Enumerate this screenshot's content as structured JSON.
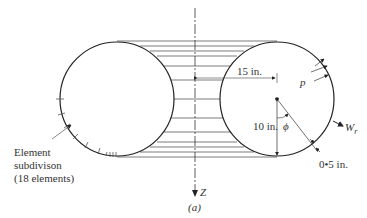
{
  "figure": {
    "caption": "(a)",
    "axis_label": "Z",
    "dimensions": {
      "radius_offset": "15 in.",
      "tube_radius": "10 in.",
      "wall_thickness": "0•5 in."
    },
    "symbols": {
      "pressure": "p",
      "angle": "ϕ",
      "radial_displacement": "W",
      "radial_subscript": "r"
    },
    "annotation": {
      "line1": "Element",
      "line2": "subdivison",
      "line3": "(18 elements)"
    }
  }
}
